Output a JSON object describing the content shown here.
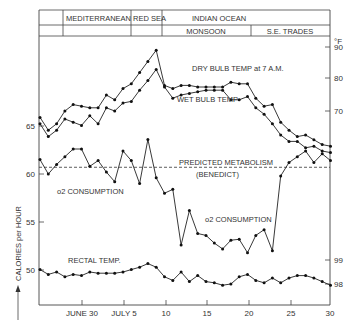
{
  "header": {
    "regions_top": [
      "MEDITERRANEAN",
      "RED SEA",
      "INDIAN OCEAN"
    ],
    "regions_bottom": [
      "MONSOON",
      "S.E. TRADES"
    ]
  },
  "axes": {
    "left_label": "CALORIES per HOUR",
    "left_ticks": [
      "65",
      "60",
      "55",
      "50"
    ],
    "right_unit": "°F",
    "right_ticks_air": [
      "90",
      "80",
      "70"
    ],
    "right_ticks_rectal": [
      "99",
      "98"
    ],
    "x_ticks": [
      "JUNE 30",
      "JULY 5",
      "10",
      "15",
      "20",
      "25",
      "30"
    ]
  },
  "annotations": {
    "dry_bulb": "DRY BULB TEMP at 7 A.M.",
    "wet_bulb": "WET BULB TEMP",
    "predicted": "PREDICTED METABOLISM",
    "benedict": "(BENEDICT)",
    "o2_left": "o2 CONSUMPTION",
    "o2_right": "o2 CONSUMPTION",
    "rectal": "RECTAL TEMP."
  },
  "chart_data": {
    "type": "line",
    "title": "",
    "xlabel": "Date (June 25 – July 30)",
    "ylabel_left": "CALORIES per HOUR",
    "ylabel_right": "°F",
    "x": [
      "Jun25",
      "Jun26",
      "Jun27",
      "Jun28",
      "Jun29",
      "Jun30",
      "Jul1",
      "Jul2",
      "Jul3",
      "Jul4",
      "Jul5",
      "Jul6",
      "Jul7",
      "Jul8",
      "Jul9",
      "Jul10",
      "Jul11",
      "Jul12",
      "Jul13",
      "Jul14",
      "Jul15",
      "Jul16",
      "Jul17",
      "Jul18",
      "Jul19",
      "Jul20",
      "Jul21",
      "Jul22",
      "Jul23",
      "Jul24",
      "Jul25",
      "Jul26",
      "Jul27",
      "Jul28",
      "Jul29",
      "Jul30"
    ],
    "series": [
      {
        "name": "DRY BULB TEMP at 7 A.M.",
        "axis": "right_F",
        "values": [
          68,
          64,
          66,
          70,
          72,
          71.5,
          71,
          71,
          75,
          73.5,
          77,
          78.5,
          82,
          85.5,
          89,
          78,
          77,
          78,
          78,
          77.5,
          77.5,
          77.5,
          77.5,
          79,
          78.5,
          78.5,
          74,
          71.5,
          72,
          66.5,
          64,
          62,
          62.5,
          61,
          59.5,
          59
        ]
      },
      {
        "name": "WET BULB TEMP",
        "axis": "right_F",
        "values": [
          66,
          62,
          64,
          67.5,
          66.5,
          65.5,
          68.5,
          66,
          71,
          70,
          72.5,
          73,
          76.5,
          79.5,
          83,
          77.5,
          74,
          75,
          75.5,
          76,
          76.5,
          76.5,
          76.5,
          73.5,
          73.5,
          74.5,
          71,
          69,
          66,
          62.5,
          60.5,
          60.5,
          58.5,
          59,
          57.5,
          57
        ]
      },
      {
        "name": "o2 CONSUMPTION",
        "axis": "left_cal",
        "values": [
          61.5,
          60,
          61,
          61.8,
          62.6,
          62.6,
          60.8,
          61.4,
          60.2,
          59.2,
          62.4,
          61.4,
          59,
          63.6,
          59.6,
          58,
          58.4,
          52.6,
          56.2,
          53.8,
          53.6,
          52.8,
          52.2,
          53.1,
          53.2,
          51.8,
          53.6,
          54.2,
          52,
          59.8,
          61.2,
          61.8,
          62.4,
          61.2,
          62.1,
          61.4
        ]
      },
      {
        "name": "PREDICTED METABOLISM (BENEDICT)",
        "axis": "left_cal",
        "constant": 60.7
      },
      {
        "name": "RECTAL TEMP.",
        "axis": "right_F",
        "values": [
          98.6,
          98.4,
          98.5,
          98.3,
          98.4,
          98.35,
          98.5,
          98.45,
          98.45,
          98.45,
          98.5,
          98.6,
          98.7,
          98.85,
          98.7,
          98.3,
          98.15,
          98.5,
          98.1,
          98.35,
          98.1,
          98.05,
          97.95,
          98.0,
          98.3,
          98.4,
          98.15,
          98.05,
          98.25,
          98.05,
          98.25,
          98.35,
          98.35,
          98.25,
          98.1,
          97.95
        ]
      }
    ],
    "ylim_left": [
      46,
      72
    ],
    "ylim_right_air": [
      55,
      93
    ],
    "ylim_right_rectal": [
      97.5,
      99.5
    ],
    "grid": false,
    "legend": "inline annotations"
  }
}
